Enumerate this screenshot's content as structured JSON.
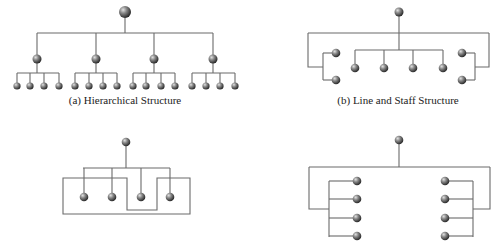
{
  "diagrams": [
    {
      "id": "a",
      "caption": "(a) Hierarchical Structure",
      "caption_pos": [
        125,
        94
      ],
      "nodes": {
        "top": {
          "x": 125,
          "y": 12,
          "r": 6
        },
        "mid": [
          {
            "x": 37,
            "y": 59,
            "r": 4.5
          },
          {
            "x": 96,
            "y": 59,
            "r": 4.5
          },
          {
            "x": 154,
            "y": 59,
            "r": 4.5
          },
          {
            "x": 213,
            "y": 59,
            "r": 4.5
          }
        ],
        "leaves": [
          [
            17,
            30,
            44,
            59
          ],
          [
            75,
            89,
            103,
            117
          ],
          [
            133,
            146,
            161,
            175
          ],
          [
            192,
            206,
            220,
            235
          ]
        ],
        "leaf_y": 86,
        "leaf_r": 3.6
      },
      "lines": [
        "M125 18 V33",
        "M37 33 H213",
        "M37 33 V55",
        "M96 33 V55",
        "M154 33 V55",
        "M213 33 V55",
        "M37 63 V73",
        "M17 73 H59",
        "M17 73 V83",
        "M30 73 V83",
        "M44 73 V83",
        "M59 73 V83",
        "M96 63 V73",
        "M75 73 H117",
        "M75 73 V83",
        "M89 73 V83",
        "M103 73 V83",
        "M117 73 V83",
        "M154 63 V73",
        "M133 73 H175",
        "M133 73 V83",
        "M146 73 V83",
        "M161 73 V83",
        "M175 73 V83",
        "M213 63 V73",
        "M192 73 H235",
        "M192 73 V83",
        "M206 73 V83",
        "M220 73 V83",
        "M235 73 V83"
      ]
    },
    {
      "id": "b",
      "caption": "(b) Line and Staff Structure",
      "caption_pos": [
        398,
        94
      ],
      "nodes": {
        "all": [
          {
            "x": 399,
            "y": 12,
            "r": 4.5
          },
          {
            "x": 336,
            "y": 53,
            "r": 4.3
          },
          {
            "x": 336,
            "y": 80,
            "r": 4.3
          },
          {
            "x": 355,
            "y": 68,
            "r": 4.3
          },
          {
            "x": 384,
            "y": 68,
            "r": 4.3
          },
          {
            "x": 413,
            "y": 68,
            "r": 4.3
          },
          {
            "x": 443,
            "y": 68,
            "r": 4.3
          },
          {
            "x": 462,
            "y": 53,
            "r": 4.3
          },
          {
            "x": 462,
            "y": 80,
            "r": 4.3
          }
        ]
      },
      "lines": [
        "M399 16 V50",
        "M308 33 H489",
        "M308 33 V67 H323",
        "M323 53 V80",
        "M323 53 H332",
        "M323 80 H332",
        "M489 33 V67 H475",
        "M475 53 V80",
        "M475 53 H466",
        "M475 80 H466",
        "M355 50 H443",
        "M355 50 V64",
        "M384 50 V64",
        "M413 50 V64",
        "M443 50 V64"
      ]
    },
    {
      "id": "c",
      "caption": "",
      "nodes": {
        "all": [
          {
            "x": 126,
            "y": 142,
            "r": 4.3
          },
          {
            "x": 84,
            "y": 197,
            "r": 4.3
          },
          {
            "x": 112,
            "y": 197,
            "r": 4.3
          },
          {
            "x": 141,
            "y": 197,
            "r": 4.3
          },
          {
            "x": 170,
            "y": 197,
            "r": 4.3
          }
        ]
      },
      "lines": [
        "M126 146 V168",
        "M83 168 H170",
        "M84 168 V193",
        "M112 168 V193",
        "M141 168 V193",
        "M170 168 V193",
        "M63 178 H127 V210 H157 V178 H190 V214 H63 Z"
      ]
    },
    {
      "id": "d",
      "caption": "",
      "nodes": {
        "all": [
          {
            "x": 399,
            "y": 140,
            "r": 4.3
          },
          {
            "x": 357,
            "y": 181,
            "r": 4.3
          },
          {
            "x": 357,
            "y": 199,
            "r": 4.3
          },
          {
            "x": 357,
            "y": 218,
            "r": 4.3
          },
          {
            "x": 357,
            "y": 236,
            "r": 4.3
          },
          {
            "x": 445,
            "y": 181,
            "r": 4.3
          },
          {
            "x": 445,
            "y": 199,
            "r": 4.3
          },
          {
            "x": 445,
            "y": 218,
            "r": 4.3
          },
          {
            "x": 445,
            "y": 236,
            "r": 4.3
          }
        ]
      },
      "lines": [
        "M399 144 V167",
        "M309 167 H490",
        "M309 167 V209 H329",
        "M329 181 V237",
        "M329 181 H353",
        "M329 199 H353",
        "M329 218 H353",
        "M329 236 H353",
        "M490 167 V209 H473",
        "M473 181 V237",
        "M473 181 H449",
        "M473 199 H449",
        "M473 218 H449",
        "M473 236 H449"
      ]
    }
  ],
  "style": {
    "line_color": "#6b6b6b",
    "node_highlight": "#d8d8d8",
    "node_mid": "#7a7a7a",
    "node_dark": "#2a2a2a"
  }
}
